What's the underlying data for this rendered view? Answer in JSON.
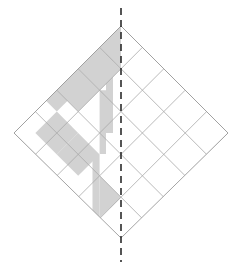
{
  "figure": {
    "name": "quilt-block-symmetry-diagram",
    "title": "Rotated square grid with shaded patches and vertical mirror line",
    "canvas": {
      "width": 240,
      "height": 267,
      "background": "#ffffff"
    }
  },
  "geometry": {
    "grid_size": 5,
    "rotation_deg": 45,
    "cell_half_diagonal": 21.4,
    "center": {
      "x": 121,
      "y": 132
    },
    "vertices": {
      "top": {
        "x": 121,
        "y": 26
      },
      "left": {
        "x": 14,
        "y": 133
      },
      "right": {
        "x": 228,
        "y": 133
      },
      "bottom": {
        "x": 121,
        "y": 238
      }
    }
  },
  "style": {
    "shade_fill": "#d2d2d2",
    "shade_fill_light": "#dcdcdc",
    "grid_stroke": "#a8a8a8",
    "outline_stroke": "#9a9a9a",
    "grid_stroke_width": 0.8,
    "outline_stroke_width": 0.9,
    "mirror_stroke": "#2b2b2b",
    "mirror_stroke_width": 1.6,
    "mirror_dash": "7 5"
  },
  "mirror_line": {
    "label": "vertical-mirror-axis",
    "x": 121,
    "y_start": 8,
    "y_end": 262,
    "orientation": "vertical",
    "dashed": true
  },
  "shaded_patches": [
    {
      "id": "patch-apex-left-half",
      "kind": "triangle",
      "row": 0,
      "col": 4
    },
    {
      "id": "patch-upper-band-a",
      "kind": "full",
      "row": 1,
      "col": 3
    },
    {
      "id": "patch-upper-band-b",
      "kind": "full",
      "row": 2,
      "col": 2
    },
    {
      "id": "patch-upper-band-c",
      "kind": "full",
      "row": 2,
      "col": 3
    },
    {
      "id": "patch-strip-upper",
      "kind": "strip",
      "row": 1,
      "col": 4
    },
    {
      "id": "patch-strip-mid",
      "kind": "strip",
      "row": 2,
      "col": 4
    },
    {
      "id": "patch-left-block",
      "kind": "full",
      "row": 3,
      "col": 1
    },
    {
      "id": "patch-center-left",
      "kind": "full",
      "row": 3,
      "col": 2
    },
    {
      "id": "patch-strip-lower",
      "kind": "strip",
      "row": 4,
      "col": 3
    },
    {
      "id": "patch-bottom-triangle",
      "kind": "triangle",
      "row": 5,
      "col": 3
    }
  ],
  "shape_counts": {
    "total_cells": 25,
    "shaded_full_cells": 5,
    "shaded_half_triangles": 2,
    "shaded_strips": 3
  }
}
